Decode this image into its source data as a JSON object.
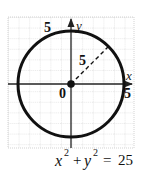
{
  "diagram": {
    "type": "circle-graph",
    "equation": {
      "x": "x",
      "y": "y",
      "exp": "2",
      "plus": "+",
      "equals": "=",
      "rhs": "25"
    },
    "axes": {
      "x_label": "x",
      "y_label": "y",
      "origin_label": "0"
    },
    "labels": {
      "top_five": "5",
      "right_five": "5",
      "radius_five": "5"
    },
    "circle": {
      "center": [
        0,
        0
      ],
      "radius": 5
    },
    "colors": {
      "grid": "#c8c8c8",
      "axis": "#222222",
      "circle": "#111111"
    }
  }
}
